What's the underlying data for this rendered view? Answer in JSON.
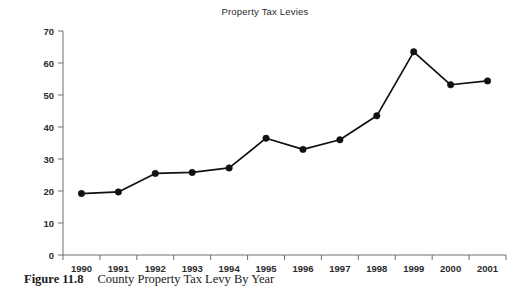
{
  "chart_data": {
    "type": "line",
    "title": "Property Tax Levies",
    "xlabel": "",
    "ylabel": "Property Tax Levies (in millions)",
    "categories": [
      "1990",
      "1991",
      "1992",
      "1993",
      "1994",
      "1995",
      "1996",
      "1997",
      "1998",
      "1999",
      "2000",
      "2001"
    ],
    "values": [
      19.2,
      19.7,
      25.5,
      25.8,
      27.2,
      36.5,
      33.0,
      36.0,
      43.5,
      63.5,
      53.2,
      54.4
    ],
    "ylim": [
      0,
      70
    ],
    "yticks": [
      0,
      10,
      20,
      30,
      40,
      50,
      60,
      70
    ],
    "ytick_labels": [
      "0",
      "10",
      "20",
      "30",
      "40",
      "50",
      "60",
      "70"
    ],
    "grid": false,
    "legend": false,
    "marker": "filled-circle",
    "line_color": "#111111",
    "marker_color": "#111111",
    "axis_color": "#6f6f6f"
  },
  "caption": {
    "figure_number": "Figure 11.8",
    "figure_text": "County Property Tax Levy By Year"
  }
}
